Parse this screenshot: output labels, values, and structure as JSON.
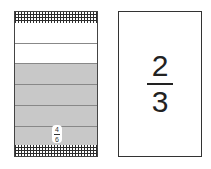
{
  "fraction_bar": {
    "total_parts": 6,
    "shaded_parts": 4,
    "label": {
      "numerator": "4",
      "denominator": "6"
    },
    "colors": {
      "shaded": "#c8c8c8",
      "unshaded": "#ffffff",
      "border": "#444444"
    }
  },
  "fraction_card": {
    "numerator": "2",
    "denominator": "3"
  }
}
